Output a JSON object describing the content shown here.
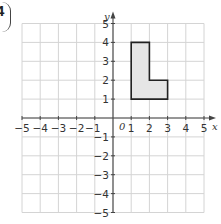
{
  "question_number": "4",
  "chart_data": {
    "type": "polygon-on-grid",
    "title": "",
    "xlabel": "x",
    "ylabel": "y",
    "xlim": [
      -5,
      5
    ],
    "ylim": [
      -5,
      5
    ],
    "grid": true,
    "x_ticks": [
      "-5",
      "-4",
      "-3",
      "-2",
      "-1",
      "1",
      "2",
      "3",
      "4",
      "5"
    ],
    "y_ticks": [
      "5",
      "4",
      "3",
      "2",
      "1",
      "-1",
      "-2",
      "-3",
      "-4",
      "-5"
    ],
    "origin_label": "0",
    "shape": {
      "name": "L-shape",
      "fill": "#e6e6e6",
      "stroke": "#222222",
      "vertices": [
        [
          1,
          1
        ],
        [
          1,
          4
        ],
        [
          2,
          4
        ],
        [
          2,
          2
        ],
        [
          3,
          2
        ],
        [
          3,
          1
        ]
      ]
    }
  }
}
